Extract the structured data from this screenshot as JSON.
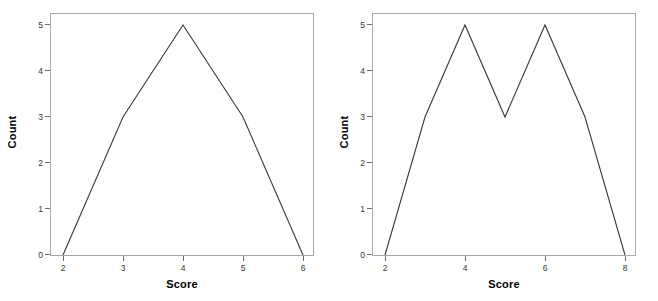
{
  "figure": {
    "background_color": "#ffffff",
    "frame_color": "#a8a8a8",
    "line_color": "#3a3a3a",
    "panels": [
      {
        "name": "left",
        "y_axis_title": "Count",
        "x_axis_title": "Score",
        "y_ticks": [
          "0",
          "1",
          "2",
          "3",
          "4",
          "5"
        ],
        "x_ticks": [
          "2",
          "3",
          "4",
          "5",
          "6"
        ]
      },
      {
        "name": "right",
        "y_axis_title": "Count",
        "x_axis_title": "Score",
        "y_ticks": [
          "0",
          "1",
          "2",
          "3",
          "4",
          "5"
        ],
        "x_ticks": [
          "2",
          "4",
          "6",
          "8"
        ]
      }
    ]
  },
  "chart_data": [
    {
      "type": "line",
      "title": "",
      "xlabel": "Score",
      "ylabel": "Count",
      "x": [
        2,
        3,
        4,
        5,
        6
      ],
      "values": [
        0,
        3,
        5,
        3,
        0
      ],
      "series": [
        {
          "name": "Count",
          "values": [
            0,
            3,
            5,
            3,
            0
          ]
        }
      ],
      "xlim": [
        2,
        6
      ],
      "ylim": [
        0,
        5
      ],
      "x_tick_values": [
        2,
        3,
        4,
        5,
        6
      ],
      "x_tick_labels": [
        "2",
        "3",
        "4",
        "5",
        "6"
      ],
      "y_tick_values": [
        0,
        1,
        2,
        3,
        4,
        5
      ],
      "y_tick_labels": [
        "0",
        "1",
        "2",
        "3",
        "4",
        "5"
      ],
      "grid": false,
      "legend": false,
      "legend_position": "none",
      "line_color": "#3a3a3a",
      "markers": false,
      "annotations": []
    },
    {
      "type": "line",
      "title": "",
      "xlabel": "Score",
      "ylabel": "Count",
      "x": [
        2,
        3,
        4,
        5,
        6,
        7,
        8
      ],
      "values": [
        0,
        3,
        5,
        3,
        5,
        3,
        0
      ],
      "series": [
        {
          "name": "Count",
          "values": [
            0,
            3,
            5,
            3,
            5,
            3,
            0
          ]
        }
      ],
      "xlim": [
        2,
        8
      ],
      "ylim": [
        0,
        5
      ],
      "x_tick_values": [
        2,
        4,
        6,
        8
      ],
      "x_tick_labels": [
        "2",
        "4",
        "6",
        "8"
      ],
      "y_tick_values": [
        0,
        1,
        2,
        3,
        4,
        5
      ],
      "y_tick_labels": [
        "0",
        "1",
        "2",
        "3",
        "4",
        "5"
      ],
      "grid": false,
      "legend": false,
      "legend_position": "none",
      "line_color": "#3a3a3a",
      "markers": false,
      "annotations": []
    }
  ]
}
